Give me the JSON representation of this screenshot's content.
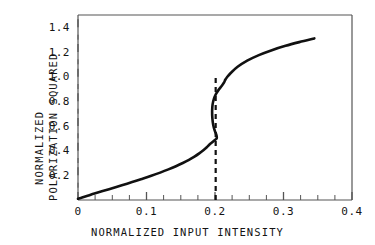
{
  "chart_data": {
    "type": "line",
    "title": "",
    "xlabel": "NORMALIZED INPUT INTENSITY",
    "ylabel": "NORMALIZED POLARIZATION SQUARED",
    "ylabel_lines": [
      "NORMALIZED",
      "POLARIZATION SQUARED"
    ],
    "xlim": [
      0,
      0.4
    ],
    "ylim": [
      0,
      1.5
    ],
    "xticks": [
      0,
      0.1,
      0.2,
      0.3,
      0.4
    ],
    "xtick_labels": [
      "0",
      "0.1",
      "0.2",
      "0.3",
      "0.4"
    ],
    "yticks": [
      0.2,
      0.4,
      0.6,
      0.8,
      1.0,
      1.2,
      1.4
    ],
    "ytick_labels": [
      "0.2",
      "0.4",
      "0.6",
      "0.8",
      "1.0",
      "1.2",
      "1.4"
    ],
    "minor_xtick_step": 0.025,
    "minor_ytick_step": 0.1,
    "grid": false,
    "legend": "none",
    "line_color": "#111111",
    "line_width_px": 2.6,
    "series": [
      {
        "name": "bistable hysteresis curve",
        "style": "solid",
        "x": [
          0.0,
          0.006,
          0.014,
          0.024,
          0.036,
          0.05,
          0.064,
          0.079,
          0.093,
          0.107,
          0.12,
          0.132,
          0.143,
          0.153,
          0.162,
          0.17,
          0.177,
          0.183,
          0.188,
          0.192,
          0.196,
          0.199,
          0.201,
          0.2025,
          0.2025,
          0.2015,
          0.1995,
          0.1975,
          0.1962,
          0.1958,
          0.1965,
          0.1985,
          0.2015,
          0.2055,
          0.2105,
          0.2135,
          0.215,
          0.2175,
          0.223,
          0.233,
          0.247,
          0.264,
          0.283,
          0.303,
          0.323,
          0.345
        ],
        "y": [
          0.01,
          0.02,
          0.034,
          0.052,
          0.072,
          0.096,
          0.12,
          0.145,
          0.17,
          0.196,
          0.222,
          0.248,
          0.274,
          0.3,
          0.326,
          0.352,
          0.378,
          0.404,
          0.428,
          0.45,
          0.468,
          0.482,
          0.492,
          0.5,
          0.515,
          0.535,
          0.565,
          0.605,
          0.66,
          0.72,
          0.775,
          0.822,
          0.86,
          0.895,
          0.93,
          0.955,
          0.975,
          0.995,
          1.03,
          1.08,
          1.13,
          1.175,
          1.215,
          1.25,
          1.28,
          1.31
        ]
      }
    ],
    "annotations": [
      {
        "name": "switching-threshold-line",
        "style": "dashed",
        "orientation": "vertical",
        "x": 0.201,
        "y_from": 0.0,
        "y_to": 1.005,
        "color": "#111111",
        "dash": "5,4",
        "width_px": 2.2
      }
    ]
  },
  "axes": {
    "frame_color": "#555555",
    "tick_color": "#555555",
    "background": "#ffffff"
  }
}
